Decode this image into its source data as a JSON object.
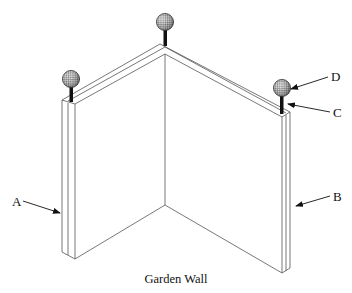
{
  "diagram": {
    "caption": "Garden Wall",
    "labels": {
      "A": "A",
      "B": "B",
      "C": "C",
      "D": "D"
    },
    "parts": {
      "A": "left wall end face",
      "B": "right wall end face",
      "C": "post stem on wall top",
      "D": "spherical finial ball"
    },
    "colors": {
      "line": "#555555",
      "ink": "#111111",
      "background": "#ffffff"
    }
  }
}
